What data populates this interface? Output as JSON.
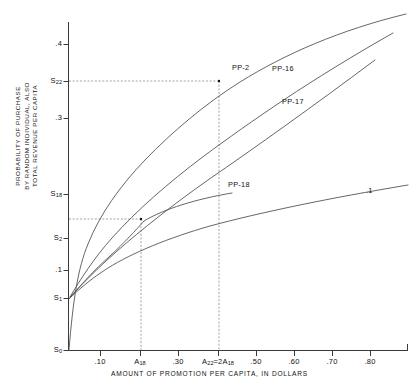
{
  "chart_data": {
    "type": "line",
    "title": "",
    "xlabel": "AMOUNT OF PROMOTION PER CAPITA, IN DOLLARS",
    "ylabel_lines": [
      "PROBABILITY OF PURCHASE",
      "BY RANDOM INDIVIDUAL, ALSO",
      "TOTAL REVENUE PER CAPITA"
    ],
    "grid": false,
    "legend_position": "inline-curve-labels",
    "xlim": [
      0,
      0.9
    ],
    "ylim": [
      0,
      0.46
    ],
    "x_ticks": [
      {
        "label": ".10",
        "value": 0.1,
        "px": 100
      },
      {
        "label": "A",
        "sub": "18",
        "value": 0.2,
        "px": 140
      },
      {
        "label": ".30",
        "value": 0.3,
        "px": 178
      },
      {
        "label": "A",
        "sub": "22",
        "label2": "=2A",
        "sub2": "18",
        "value": 0.4,
        "px": 218
      },
      {
        "label": ".50",
        "value": 0.5,
        "px": 256
      },
      {
        "label": ".60",
        "value": 0.6,
        "px": 294
      },
      {
        "label": ".70",
        "value": 0.7,
        "px": 332
      },
      {
        "label": ".80",
        "value": 0.8,
        "px": 370
      }
    ],
    "y_ticks": [
      {
        "label": ".4",
        "value": 0.4,
        "px": 44
      },
      {
        "label": "S",
        "sub": "22",
        "value": 0.355,
        "px": 81
      },
      {
        "label": ".3",
        "value": 0.3,
        "px": 118
      },
      {
        "label": "S",
        "sub": "18",
        "value": 0.205,
        "px": 194
      },
      {
        "label": "S",
        "sub": "2",
        "value": 0.15,
        "px": 238
      },
      {
        "label": ".1",
        "value": 0.1,
        "px": 270
      },
      {
        "label": "S",
        "sub": "1",
        "value": 0.065,
        "px": 298
      },
      {
        "label": "S",
        "sub": "0",
        "value": 0.0,
        "px": 350
      }
    ],
    "series": [
      {
        "name": "PP-2",
        "label": "PP-2",
        "label_px": {
          "x": 232,
          "y": 63
        },
        "path": "M 69 350 C 73 300, 78 268, 88 244 C 100 214, 120 186, 145 160 C 172 132, 205 104, 240 82 C 285 54, 340 30, 406 14"
      },
      {
        "name": "PP-16",
        "label": "PP-16",
        "label_px": {
          "x": 272,
          "y": 64
        },
        "path": "M 70 297 C 80 280, 94 258, 112 238 C 136 211, 168 183, 204 156 C 250 122, 310 80, 393 33"
      },
      {
        "name": "PP-17",
        "label": "PP-17",
        "label_px": {
          "x": 282,
          "y": 97
        },
        "path": "M 70 297 C 82 284, 98 268, 116 252 C 142 229, 174 204, 208 180 C 256 147, 312 107, 375 60"
      },
      {
        "name": "PP-18",
        "label": "PP-18",
        "label_px": {
          "x": 228,
          "y": 180
        },
        "path": "M 70 298 C 80 286, 94 270, 110 256 C 124 243, 136 230, 144 221 C 164 209, 196 199, 232 193"
      },
      {
        "name": "lower-curve",
        "label": ".1",
        "label_px": {
          "x": 366,
          "y": 186
        },
        "path": "M 69 299 C 78 290, 92 278, 108 268 C 132 253, 168 238, 210 226 C 262 212, 330 198, 408 185"
      }
    ],
    "guide_lines": [
      {
        "name": "s22-horizontal",
        "from_px": {
          "x": 69,
          "y": 81
        },
        "to_px": {
          "x": 219,
          "y": 81
        }
      },
      {
        "name": "a22-vertical",
        "from_px": {
          "x": 219,
          "y": 81
        },
        "to_px": {
          "x": 219,
          "y": 350
        }
      },
      {
        "name": "s-lower-horizontal",
        "from_px": {
          "x": 69,
          "y": 219
        },
        "to_px": {
          "x": 141,
          "y": 219
        }
      },
      {
        "name": "a18-vertical",
        "from_px": {
          "x": 141,
          "y": 219
        },
        "to_px": {
          "x": 141,
          "y": 350
        }
      }
    ],
    "markers": [
      {
        "name": "point-s22-a22",
        "px": {
          "x": 219,
          "y": 81
        }
      },
      {
        "name": "point-s-lower-a18",
        "px": {
          "x": 141,
          "y": 219
        }
      }
    ],
    "colors": {
      "axis": "#3a3a3a",
      "curve": "#555555",
      "guide": "#8a8a8a",
      "text": "#111111",
      "background": "#ffffff"
    }
  }
}
